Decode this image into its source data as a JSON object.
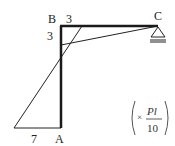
{
  "diagram": {
    "type": "bending-moment-diagram",
    "nodes": {
      "A": {
        "label": "A"
      },
      "B": {
        "label": "B"
      },
      "C": {
        "label": "C"
      }
    },
    "values": {
      "beam_at_B": "3",
      "column_at_B": "3",
      "column_at_A": "7"
    },
    "unit": {
      "prefix": "×",
      "numerator": "Pl",
      "denominator": "10"
    },
    "colors": {
      "frame": "#1a1a1a",
      "moment": "#222222"
    }
  }
}
